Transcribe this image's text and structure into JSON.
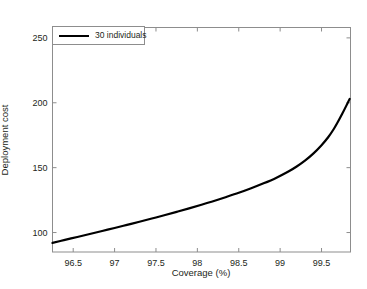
{
  "chart_data": {
    "type": "line",
    "title": "",
    "xlabel": "Coverage (%)",
    "ylabel": "Deployment cost",
    "xlim": [
      96.25,
      99.85
    ],
    "ylim": [
      85,
      258
    ],
    "xticks": [
      96.5,
      97,
      97.5,
      98,
      98.5,
      99,
      99.5
    ],
    "xtick_labels": [
      "96.5",
      "97",
      "97.5",
      "98",
      "98.5",
      "99",
      "99.5"
    ],
    "yticks": [
      100,
      150,
      200,
      250
    ],
    "ytick_labels": [
      "100",
      "150",
      "200",
      "250"
    ],
    "grid": false,
    "legend_position": "upper left",
    "series": [
      {
        "name": "30 individuals",
        "color": "#000000",
        "linewidth": 2.2,
        "x": [
          96.25,
          96.4,
          96.55,
          96.7,
          96.85,
          97.0,
          97.15,
          97.3,
          97.45,
          97.6,
          97.75,
          97.9,
          98.05,
          98.2,
          98.35,
          98.5,
          98.65,
          98.8,
          98.95,
          99.1,
          99.2,
          99.3,
          99.4,
          99.5,
          99.58,
          99.65,
          99.7,
          99.75,
          99.8,
          99.84
        ],
        "y": [
          92.0,
          94.3,
          96.6,
          98.9,
          101.2,
          103.5,
          105.9,
          108.3,
          110.8,
          113.3,
          115.9,
          118.6,
          121.4,
          124.3,
          127.4,
          130.6,
          134.1,
          137.9,
          142.1,
          147.0,
          150.9,
          155.4,
          160.8,
          167.3,
          173.4,
          180.0,
          185.5,
          191.5,
          197.8,
          203.0
        ]
      }
    ]
  },
  "legend": {
    "label": "30 individuals"
  },
  "axes": {
    "x_title": "Coverage (%)",
    "y_title": "Deployment cost",
    "xtick_labels": [
      "96.5",
      "97",
      "97.5",
      "98",
      "98.5",
      "99",
      "99.5"
    ],
    "ytick_labels": [
      "100",
      "150",
      "200",
      "250"
    ]
  },
  "colors": {
    "line": "#000000",
    "axis": "#8d8d8d",
    "text": "#231f20",
    "background": "#ffffff"
  }
}
